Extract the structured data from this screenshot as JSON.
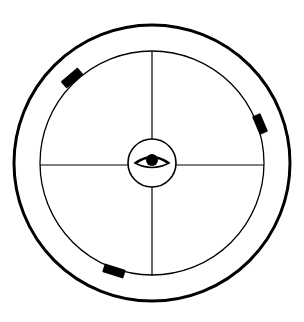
{
  "diagram": {
    "type": "circular-line-drawing",
    "colors": {
      "stroke": "#000000",
      "background": "#ffffff"
    },
    "outer_ring": {
      "cx": 152,
      "cy": 163,
      "r": 138
    },
    "inner_circle": {
      "cx": 152,
      "cy": 163,
      "r": 113
    },
    "center_circle": {
      "cx": 152,
      "cy": 163,
      "r": 24
    },
    "center_icon": "eye-icon",
    "crosshair": "cross-lines-dividing-four-quadrants",
    "markers": [
      {
        "name": "marker-upper-left",
        "angle_deg": 228
      },
      {
        "name": "marker-right",
        "angle_deg": 343
      },
      {
        "name": "marker-bottom",
        "angle_deg": 109
      }
    ]
  }
}
